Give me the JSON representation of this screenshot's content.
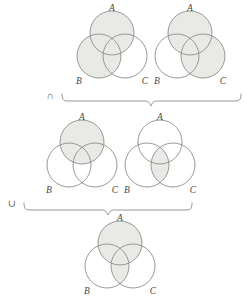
{
  "figure": {
    "type": "venn-diagram-set-identity",
    "identity": "(A ∪ B) ∩ (A ∪ C) = A ∪ (B ∩ C)",
    "background_color": "#ffffff",
    "shade_color": "#e9e9e6",
    "stroke_color": "#8c8c8c",
    "label_color": "#4a4a4a"
  },
  "labels": {
    "a": "A",
    "b": "B",
    "c": "C"
  },
  "operators": {
    "intersection": "∩",
    "union": "∪"
  },
  "diagrams": [
    {
      "id": "diagram-1",
      "row": "top",
      "position": "left",
      "expression": "A ∪ B",
      "shaded_regions": [
        "A",
        "B"
      ],
      "shaded_description": "circle A and circle B fully shaded",
      "labels": {
        "a": "A",
        "b": "B",
        "c": "C"
      },
      "center": {
        "x": 112,
        "y": 48
      },
      "radius": 22
    },
    {
      "id": "diagram-2",
      "row": "top",
      "position": "right",
      "expression": "A ∪ C",
      "shaded_regions": [
        "A",
        "C"
      ],
      "shaded_description": "circle A and circle C fully shaded",
      "labels": {
        "a": "A",
        "b": "B",
        "c": "C"
      },
      "center": {
        "x": 190,
        "y": 48
      },
      "radius": 22
    },
    {
      "id": "diagram-3",
      "row": "middle",
      "position": "left",
      "expression": "A",
      "shaded_regions": [
        "A"
      ],
      "shaded_description": "circle A fully shaded",
      "labels": {
        "a": "A",
        "b": "B",
        "c": "C"
      },
      "center": {
        "x": 82,
        "y": 157
      },
      "radius": 22
    },
    {
      "id": "diagram-4",
      "row": "middle",
      "position": "right",
      "expression": "B ∩ C",
      "shaded_regions": [
        "B∩C"
      ],
      "shaded_description": "lens intersection of circles B and C shaded",
      "labels": {
        "a": "A",
        "b": "B",
        "c": "C"
      },
      "center": {
        "x": 160,
        "y": 157
      },
      "radius": 22
    },
    {
      "id": "diagram-5",
      "row": "bottom",
      "position": "center",
      "expression": "A ∪ (B ∩ C)",
      "shaded_regions": [
        "A",
        "B∩C"
      ],
      "shaded_description": "circle A fully shaded plus lens intersection of B and C",
      "labels": {
        "a": "A",
        "b": "B",
        "c": "C"
      },
      "center": {
        "x": 120,
        "y": 258
      },
      "radius": 22
    }
  ],
  "braces": [
    {
      "id": "brace-top",
      "operator": "∩",
      "operator_x": 50,
      "operator_y": 96,
      "left": 62,
      "right": 241,
      "top": 94,
      "tip_x": 151,
      "depth": 12,
      "groups": [
        "diagram-1",
        "diagram-2"
      ],
      "result": "diagram-3-and-4-row"
    },
    {
      "id": "brace-middle",
      "operator": "∪",
      "operator_x": 12,
      "operator_y": 204,
      "left": 24,
      "right": 192,
      "top": 203,
      "tip_x": 108,
      "depth": 12,
      "groups": [
        "diagram-3",
        "diagram-4"
      ],
      "result": "diagram-5"
    }
  ]
}
